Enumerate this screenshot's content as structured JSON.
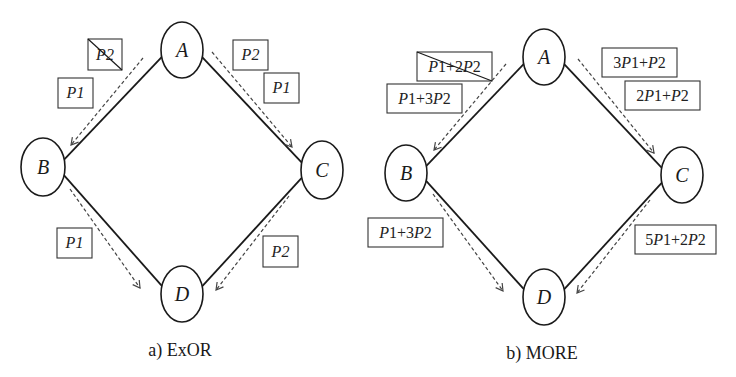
{
  "figure": {
    "panels": [
      {
        "id": "exor",
        "caption": "a) ExOR",
        "nodes": [
          {
            "id": "A",
            "label": "A",
            "cx": 182,
            "cy": 50,
            "rx": 21,
            "ry": 28
          },
          {
            "id": "B",
            "label": "B",
            "cx": 43,
            "cy": 167,
            "rx": 22,
            "ry": 29
          },
          {
            "id": "C",
            "label": "C",
            "cx": 322,
            "cy": 170,
            "rx": 21,
            "ry": 29
          },
          {
            "id": "D",
            "label": "D",
            "cx": 182,
            "cy": 294,
            "rx": 21,
            "ry": 28
          }
        ],
        "edges": [
          {
            "from": "A",
            "to": "B"
          },
          {
            "from": "A",
            "to": "C"
          },
          {
            "from": "B",
            "to": "D"
          },
          {
            "from": "C",
            "to": "D"
          }
        ],
        "flows": [
          {
            "from": "A",
            "to": "B",
            "x1": 143,
            "y1": 58,
            "x2": 71,
            "y2": 145
          },
          {
            "from": "A",
            "to": "C",
            "x1": 212,
            "y1": 52,
            "x2": 292,
            "y2": 147
          },
          {
            "from": "B",
            "to": "D",
            "x1": 70,
            "y1": 189,
            "x2": 140,
            "y2": 288
          },
          {
            "from": "C",
            "to": "D",
            "x1": 289,
            "y1": 196,
            "x2": 216,
            "y2": 290
          }
        ],
        "boxes": [
          {
            "label": "P2",
            "x": 88,
            "y": 39,
            "w": 34,
            "h": 31,
            "crossed": true
          },
          {
            "label": "P1",
            "x": 58,
            "y": 78,
            "w": 35,
            "h": 30,
            "crossed": false
          },
          {
            "label": "P2",
            "x": 233,
            "y": 40,
            "w": 35,
            "h": 30,
            "crossed": false
          },
          {
            "label": "P1",
            "x": 264,
            "y": 73,
            "w": 35,
            "h": 30,
            "crossed": false
          },
          {
            "label": "P1",
            "x": 57,
            "y": 228,
            "w": 35,
            "h": 30,
            "crossed": false
          },
          {
            "label": "P2",
            "x": 263,
            "y": 236,
            "w": 35,
            "h": 31,
            "crossed": false
          }
        ],
        "caption_x": 180,
        "caption_y": 353
      },
      {
        "id": "more",
        "caption": "b) MORE",
        "nodes": [
          {
            "id": "A",
            "label": "A",
            "cx": 544,
            "cy": 57,
            "rx": 21,
            "ry": 28
          },
          {
            "id": "B",
            "label": "B",
            "cx": 406,
            "cy": 173,
            "rx": 21,
            "ry": 28
          },
          {
            "id": "C",
            "label": "C",
            "cx": 682,
            "cy": 175,
            "rx": 21,
            "ry": 28
          },
          {
            "id": "D",
            "label": "D",
            "cx": 544,
            "cy": 297,
            "rx": 21,
            "ry": 28
          }
        ],
        "edges": [
          {
            "from": "A",
            "to": "B"
          },
          {
            "from": "A",
            "to": "C"
          },
          {
            "from": "B",
            "to": "D"
          },
          {
            "from": "C",
            "to": "D"
          }
        ],
        "flows": [
          {
            "from": "A",
            "to": "B",
            "x1": 506,
            "y1": 64,
            "x2": 434,
            "y2": 150
          },
          {
            "from": "A",
            "to": "C",
            "x1": 578,
            "y1": 59,
            "x2": 654,
            "y2": 153
          },
          {
            "from": "B",
            "to": "D",
            "x1": 433,
            "y1": 194,
            "x2": 503,
            "y2": 291
          },
          {
            "from": "C",
            "to": "D",
            "x1": 650,
            "y1": 200,
            "x2": 577,
            "y2": 293
          }
        ],
        "boxes": [
          {
            "label": "P1+2P2",
            "x": 417,
            "y": 52,
            "w": 75,
            "h": 29,
            "crossed": true
          },
          {
            "label": "P1+3P2",
            "x": 387,
            "y": 84,
            "w": 75,
            "h": 29,
            "crossed": false
          },
          {
            "label": "3P1+P2",
            "x": 602,
            "y": 48,
            "w": 75,
            "h": 29,
            "crossed": false
          },
          {
            "label": "2P1+P2",
            "x": 625,
            "y": 81,
            "w": 75,
            "h": 29,
            "crossed": false
          },
          {
            "label": "P1+3P2",
            "x": 368,
            "y": 218,
            "w": 75,
            "h": 29,
            "crossed": false
          },
          {
            "label": "5P1+2P2",
            "x": 635,
            "y": 225,
            "w": 81,
            "h": 29,
            "crossed": false
          }
        ],
        "caption_x": 542,
        "caption_y": 356
      }
    ],
    "colors": {
      "stroke": "#1a1a1a",
      "dashed": "#444444",
      "background": "#ffffff"
    }
  }
}
